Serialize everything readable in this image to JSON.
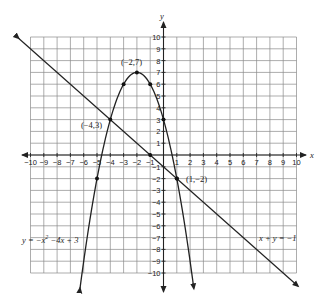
{
  "chart_data": {
    "type": "line",
    "title": "",
    "xlabel": "x",
    "ylabel": "y",
    "xlim": [
      -10,
      10
    ],
    "ylim": [
      -10,
      10
    ],
    "grid": true,
    "x_ticks": [
      -10,
      -9,
      -8,
      -7,
      -6,
      -5,
      -4,
      -3,
      -2,
      -1,
      1,
      2,
      3,
      4,
      5,
      6,
      7,
      8,
      9,
      10
    ],
    "y_ticks": [
      10,
      9,
      8,
      7,
      6,
      5,
      4,
      3,
      2,
      1,
      -1,
      -2,
      -3,
      -4,
      -5,
      -6,
      -7,
      -8,
      -9,
      -10
    ],
    "series": [
      {
        "name": "y = -x^2 - 4x + 3",
        "kind": "parabola",
        "coefficients": {
          "a": -1,
          "b": -4,
          "c": 3
        },
        "plotted_points": [
          [
            -5,
            -2
          ],
          [
            -3,
            6
          ],
          [
            -2,
            7
          ],
          [
            -1,
            6
          ],
          [
            0,
            3
          ],
          [
            1,
            -2
          ]
        ]
      },
      {
        "name": "x + y = -1",
        "kind": "line",
        "slope": -1,
        "intercept": -1,
        "plotted_points": [
          [
            -1,
            0
          ],
          [
            1,
            -2
          ]
        ]
      }
    ],
    "annotations": [
      {
        "text": "(-2,7)",
        "point": [
          -2,
          7
        ]
      },
      {
        "text": "(-4,3)",
        "point": [
          -4,
          3
        ]
      },
      {
        "text": "(1,-2)",
        "point": [
          1,
          -2
        ]
      },
      {
        "text": "y = -x² -4x + 3",
        "near": [
          -8,
          -7
        ]
      },
      {
        "text": "x + y = -1",
        "near": [
          7,
          -7
        ]
      }
    ]
  },
  "labels": {
    "x_axis": "x",
    "y_axis": "y",
    "vertex": "(−2,7)",
    "intersection_left": "(−4,3)",
    "intersection_right": "(1,−2)",
    "parabola_eq_prefix": "y = −x",
    "parabola_eq_exp": "2",
    "parabola_eq_suffix": " −4x + 3",
    "line_eq": "x + y = −1"
  }
}
